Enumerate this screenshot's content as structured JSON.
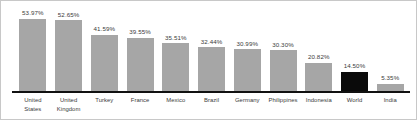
{
  "chart_data": {
    "type": "bar",
    "title": "",
    "subtitle": "",
    "xlabel": "",
    "ylabel": "",
    "ylim": [
      0,
      60
    ],
    "grid": false,
    "legend": false,
    "value_label_suffix": "%",
    "categories": [
      "United States",
      "United Kingdom",
      "Turkey",
      "France",
      "Mexico",
      "Brazil",
      "Germany",
      "Philippines",
      "Indonesia",
      "World",
      "India"
    ],
    "category_lines": [
      [
        "United",
        "States"
      ],
      [
        "United",
        "Kingdom"
      ],
      [
        "Turkey"
      ],
      [
        "France"
      ],
      [
        "Mexico"
      ],
      [
        "Brazil"
      ],
      [
        "Germany"
      ],
      [
        "Philippines"
      ],
      [
        "Indonesia"
      ],
      [
        "World"
      ],
      [
        "India"
      ]
    ],
    "values": [
      53.97,
      52.65,
      41.59,
      39.55,
      35.51,
      32.44,
      30.99,
      30.3,
      20.82,
      14.5,
      5.35
    ],
    "value_labels": [
      "53.97%",
      "52.65%",
      "41.59%",
      "39.55%",
      "35.51%",
      "32.44%",
      "30.99%",
      "30.30%",
      "20.82%",
      "14.50%",
      "5.35%"
    ],
    "highlight_index": 9,
    "colors": {
      "bar": "#a6a6a6",
      "bar_highlight": "#0a0a0a",
      "axis_line": "#111111",
      "text": "#3b3b3b",
      "background": "#ffffff",
      "border": "#c8c8c8"
    }
  }
}
